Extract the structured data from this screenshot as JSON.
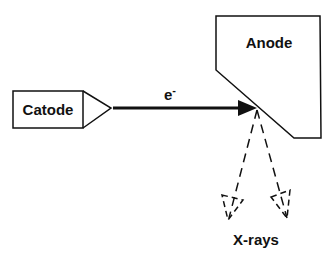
{
  "diagram": {
    "nodes": {
      "cathode": {
        "label": "Catode"
      },
      "anode": {
        "label": "Anode"
      }
    },
    "beam": {
      "label": "e",
      "superscript": "-"
    },
    "output": {
      "label": "X-rays"
    },
    "colors": {
      "stroke": "#111111",
      "background": "#ffffff"
    }
  }
}
